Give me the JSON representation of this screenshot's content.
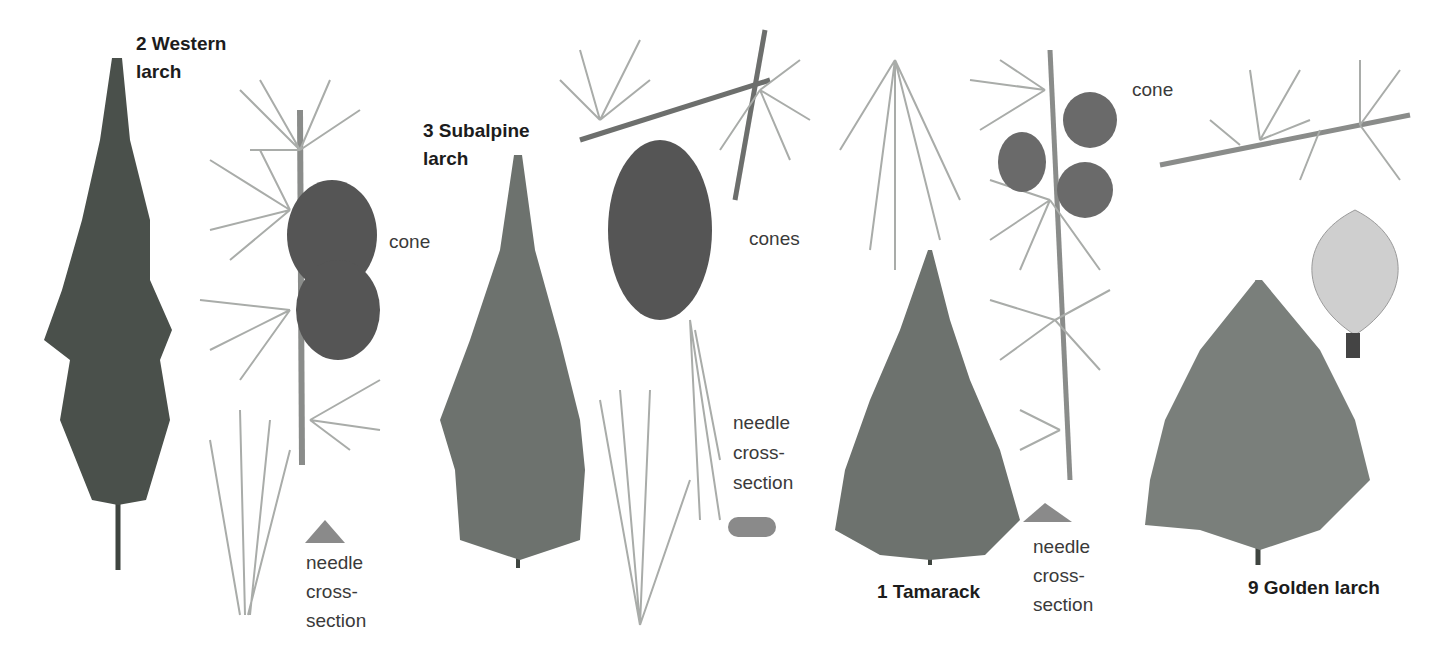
{
  "plate": {
    "title_labels": [
      {
        "id": "western",
        "text": "2 Western\nlarch"
      },
      {
        "id": "subalpine",
        "text": "3 Subalpine\nlarch"
      },
      {
        "id": "tamarack",
        "text": "1 Tamarack"
      },
      {
        "id": "golden",
        "text": "9 Golden larch"
      }
    ],
    "annotations": {
      "western_cone": "cone",
      "western_cross": "needle\ncross-\nsection",
      "subalpine_cones": "cones",
      "subalpine_cross": "needle\ncross-\nsection",
      "tamarack_cone": "cone",
      "tamarack_cross": "needle\ncross-\nsection"
    },
    "colors": {
      "background": "#ffffff",
      "tree_dark": "#3f4540",
      "tree_mid": "#6d726e",
      "needle": "#a9aca9",
      "cone": "#555555",
      "cross_section": "#8a8a8a",
      "label_bold": "#1c1c1c",
      "label_regular": "#3a3a3a"
    }
  }
}
